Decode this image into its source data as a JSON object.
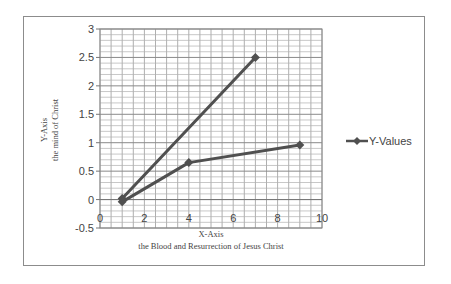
{
  "chart_data": {
    "type": "scatter",
    "title": "",
    "xlabel": "X-Axis",
    "xlabel_sub": "the Blood and Resurrection of Jesus Christ",
    "ylabel": "Y-Axis",
    "ylabel_sub": "the mind of Christ",
    "xlim": [
      0,
      10
    ],
    "ylim": [
      -0.5,
      3
    ],
    "x_ticks": [
      "0",
      "2",
      "4",
      "6",
      "8",
      "10"
    ],
    "y_ticks": [
      "3",
      "2.5",
      "2",
      "1.5",
      "1",
      "0.5",
      "0",
      "-0.5"
    ],
    "grid": true,
    "legend_position": "right",
    "series": [
      {
        "name": "Y-Values",
        "marker": "diamond",
        "line": "solid",
        "color": "#505050",
        "points": [
          {
            "x": 7,
            "y": 2.5
          },
          {
            "x": 1,
            "y": 0.02
          },
          {
            "x": 1,
            "y": -0.04
          },
          {
            "x": 4,
            "y": 0.65
          },
          {
            "x": 9,
            "y": 0.96
          }
        ]
      }
    ]
  },
  "legend": {
    "label": "Y-Values"
  }
}
